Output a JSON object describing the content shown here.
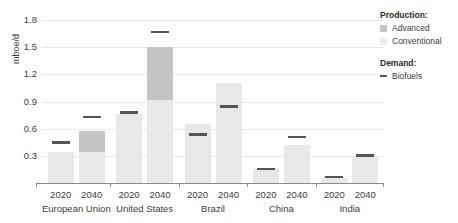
{
  "chart_data": {
    "type": "bar",
    "title": "",
    "xlabel": "",
    "ylabel": "mboe/d",
    "ylim": [
      0,
      1.8
    ],
    "yticks": [
      0.3,
      0.6,
      0.9,
      1.2,
      1.5,
      1.8
    ],
    "ytick_labels": [
      "0.3",
      "0.6",
      "0.9",
      "1.2",
      "1.5",
      "1.8"
    ],
    "grid": true,
    "legend_position": "right",
    "stacked": true,
    "groups": [
      "European Union",
      "United States",
      "Brazil",
      "China",
      "India"
    ],
    "years": [
      "2020",
      "2040"
    ],
    "series": [
      {
        "name": "Conventional",
        "color": "#e8e8e8",
        "values": [
          0.34,
          0.34,
          0.76,
          0.92,
          0.65,
          1.1,
          0.15,
          0.42,
          0.06,
          0.3
        ]
      },
      {
        "name": "Advanced",
        "color": "#c4c4c4",
        "values": [
          0.0,
          0.24,
          0.0,
          0.58,
          0.0,
          0.0,
          0.0,
          0.0,
          0.0,
          0.0
        ]
      },
      {
        "name": "Biofuels",
        "color": "#555555",
        "marker": "dash",
        "values": [
          0.46,
          0.74,
          0.79,
          1.68,
          0.55,
          0.86,
          0.17,
          0.52,
          0.08,
          0.32
        ]
      }
    ],
    "bars": [
      {
        "group": "European Union",
        "year": "2020",
        "conventional": 0.34,
        "advanced": 0.0,
        "biofuels_demand": 0.46
      },
      {
        "group": "European Union",
        "year": "2040",
        "conventional": 0.34,
        "advanced": 0.24,
        "biofuels_demand": 0.74
      },
      {
        "group": "United States",
        "year": "2020",
        "conventional": 0.76,
        "advanced": 0.0,
        "biofuels_demand": 0.79
      },
      {
        "group": "United States",
        "year": "2040",
        "conventional": 0.92,
        "advanced": 0.58,
        "biofuels_demand": 1.68
      },
      {
        "group": "Brazil",
        "year": "2020",
        "conventional": 0.65,
        "advanced": 0.0,
        "biofuels_demand": 0.55
      },
      {
        "group": "Brazil",
        "year": "2040",
        "conventional": 1.1,
        "advanced": 0.0,
        "biofuels_demand": 0.86
      },
      {
        "group": "China",
        "year": "2020",
        "conventional": 0.15,
        "advanced": 0.0,
        "biofuels_demand": 0.17
      },
      {
        "group": "China",
        "year": "2040",
        "conventional": 0.42,
        "advanced": 0.0,
        "biofuels_demand": 0.52
      },
      {
        "group": "India",
        "year": "2020",
        "conventional": 0.06,
        "advanced": 0.0,
        "biofuels_demand": 0.08
      },
      {
        "group": "India",
        "year": "2040",
        "conventional": 0.3,
        "advanced": 0.0,
        "biofuels_demand": 0.32
      }
    ]
  },
  "axis": {
    "y_title": "mboe/d",
    "ticks": [
      "1.8",
      "1.5",
      "1.2",
      "0.9",
      "0.6",
      "0.3"
    ]
  },
  "xaxis": {
    "groups": [
      {
        "name": "European Union",
        "years": [
          "2020",
          "2040"
        ]
      },
      {
        "name": "United States",
        "years": [
          "2020",
          "2040"
        ]
      },
      {
        "name": "Brazil",
        "years": [
          "2020",
          "2040"
        ]
      },
      {
        "name": "China",
        "years": [
          "2020",
          "2040"
        ]
      },
      {
        "name": "India",
        "years": [
          "2020",
          "2040"
        ]
      }
    ]
  },
  "legend": {
    "production_title": "Production:",
    "advanced_label": "Advanced",
    "conventional_label": "Conventional",
    "demand_title": "Demand:",
    "biofuels_label": "Biofuels",
    "advanced_color": "#c4c4c4",
    "conventional_color": "#ececec",
    "biofuels_color": "#555555"
  }
}
